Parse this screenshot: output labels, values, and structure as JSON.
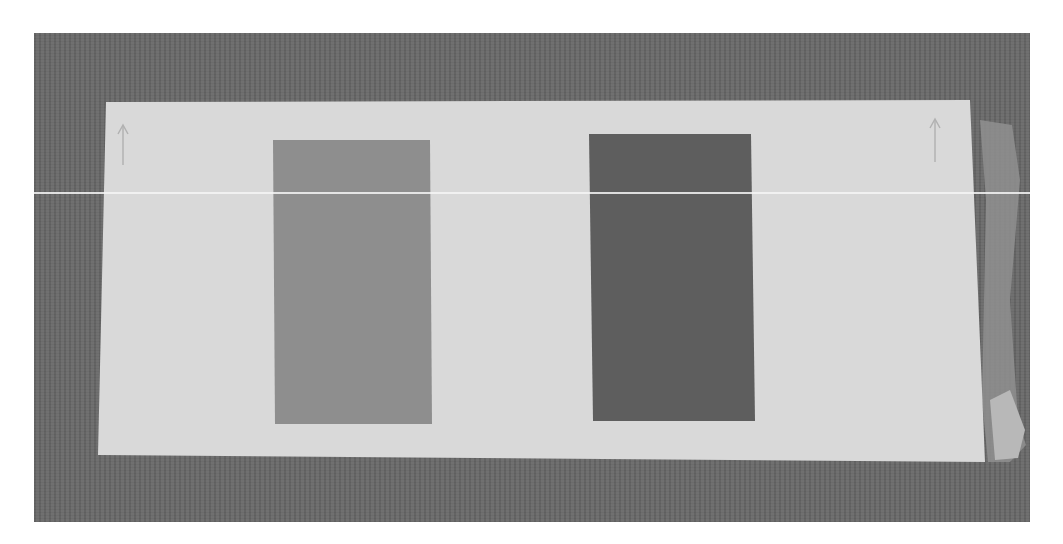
{
  "scene": {
    "description": "Grayscale photo of a white paper card on a dark textured surface with two rectangular swatches",
    "colors": {
      "page_background": "#ffffff",
      "surface": "#6a6a6a",
      "card": "#d9d9d9",
      "left_swatch": "#8e8e8e",
      "right_swatch": "#5e5e5e",
      "tape": "#a0a0a0"
    },
    "swatches": [
      {
        "name": "left-swatch",
        "shade": "medium gray"
      },
      {
        "name": "right-swatch",
        "shade": "dark gray"
      }
    ],
    "annotations": [
      {
        "name": "left-pencil-arrow",
        "glyph": "↑"
      },
      {
        "name": "right-pencil-arrow",
        "glyph": "↑"
      }
    ]
  }
}
